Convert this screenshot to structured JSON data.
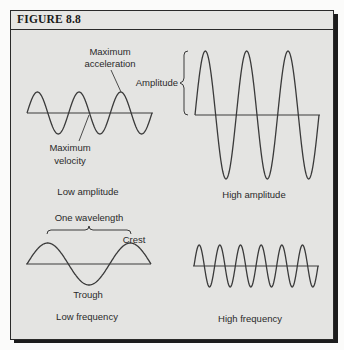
{
  "figure": {
    "title": "FIGURE 8.8"
  },
  "panels": {
    "low_amplitude": {
      "caption": "Low amplitude",
      "annotations": {
        "max_acceleration_line1": "Maximum",
        "max_acceleration_line2": "acceleration",
        "max_velocity_line1": "Maximum",
        "max_velocity_line2": "velocity"
      },
      "wave": {
        "cycles": 3,
        "amplitude_px": 21,
        "x_start": 27,
        "x_end": 152,
        "axis_y": 113
      }
    },
    "high_amplitude": {
      "caption": "High amplitude",
      "annotations": {
        "amplitude": "Amplitude"
      },
      "wave": {
        "cycles": 3,
        "amplitude_px": 64,
        "x_start": 195,
        "x_end": 319,
        "axis_y": 115
      }
    },
    "low_frequency": {
      "caption": "Low frequency",
      "annotations": {
        "wavelength": "One wavelength",
        "crest": "Crest",
        "trough": "Trough"
      },
      "wave": {
        "cycles": 1.5,
        "amplitude_px": 21,
        "x_start": 27,
        "x_end": 151,
        "axis_y": 264
      }
    },
    "high_frequency": {
      "caption": "High frequency",
      "wave": {
        "cycles": 6,
        "amplitude_px": 21,
        "x_start": 194,
        "x_end": 318,
        "axis_y": 266
      }
    }
  },
  "colors": {
    "panel_bg": "#e4e4e2",
    "line": "#3a3a3a",
    "text": "#2a2a2a",
    "border": "#2a2a2a"
  }
}
